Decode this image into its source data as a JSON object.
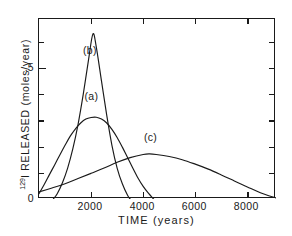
{
  "chart_data": {
    "type": "line",
    "title": "",
    "xlabel": "TIME (years)",
    "ylabel_prefix": "129",
    "ylabel_text": "I  RELEASED (moles/year)",
    "xlim": [
      0,
      9100
    ],
    "ylim": [
      0,
      0.687
    ],
    "grid": false,
    "legend_position": "inline-annotations",
    "x_ticks": [
      {
        "value": 2000,
        "label": "2000"
      },
      {
        "value": 4000,
        "label": "4000"
      },
      {
        "value": 6000,
        "label": "6000"
      },
      {
        "value": 8000,
        "label": "8000"
      }
    ],
    "y_ticks": [
      {
        "value": 0.0,
        "label": "0"
      },
      {
        "value": 0.1,
        "label": ""
      },
      {
        "value": 0.2,
        "label": ""
      },
      {
        "value": 0.3,
        "label": ""
      },
      {
        "value": 0.4,
        "label": ""
      },
      {
        "value": 0.5,
        "label": ".5"
      },
      {
        "value": 0.6,
        "label": ""
      }
    ],
    "line_color": "#1a1a1a",
    "series": [
      {
        "name": "(a)",
        "label": "(a)",
        "label_x": 2050,
        "label_y": 0.385,
        "peak_x": 2200,
        "peak_y": 0.312,
        "x": [
          0,
          200,
          400,
          600,
          800,
          1000,
          1200,
          1400,
          1600,
          1800,
          2000,
          2200,
          2400,
          2600,
          2800,
          3000,
          3200,
          3400,
          3600,
          3800,
          4000,
          4200,
          4400
        ],
        "values": [
          0.02,
          0.055,
          0.093,
          0.13,
          0.168,
          0.205,
          0.24,
          0.268,
          0.29,
          0.305,
          0.311,
          0.312,
          0.305,
          0.29,
          0.266,
          0.235,
          0.198,
          0.158,
          0.118,
          0.08,
          0.048,
          0.022,
          0.0
        ]
      },
      {
        "name": "(b)",
        "label": "(b)",
        "label_x": 1990,
        "label_y": 0.56,
        "peak_x": 2070,
        "peak_y": 0.63,
        "x": [
          550,
          700,
          900,
          1100,
          1300,
          1500,
          1700,
          1900,
          2070,
          2200,
          2400,
          2600,
          2800,
          3000,
          3200,
          3400,
          3500
        ],
        "values": [
          0.0,
          0.02,
          0.062,
          0.118,
          0.192,
          0.285,
          0.4,
          0.53,
          0.63,
          0.58,
          0.45,
          0.32,
          0.205,
          0.118,
          0.058,
          0.014,
          0.0
        ]
      },
      {
        "name": "(c)",
        "label": "(c)",
        "label_x": 4320,
        "label_y": 0.228,
        "peak_x": 4250,
        "peak_y": 0.172,
        "x": [
          0,
          500,
          1000,
          1500,
          2000,
          2500,
          3000,
          3500,
          4000,
          4250,
          4500,
          5000,
          5500,
          6000,
          6500,
          7000,
          7500,
          8000,
          8500,
          9100
        ],
        "values": [
          0.027,
          0.042,
          0.058,
          0.078,
          0.098,
          0.118,
          0.14,
          0.158,
          0.17,
          0.172,
          0.17,
          0.162,
          0.15,
          0.133,
          0.114,
          0.092,
          0.069,
          0.046,
          0.024,
          0.004
        ]
      }
    ]
  }
}
